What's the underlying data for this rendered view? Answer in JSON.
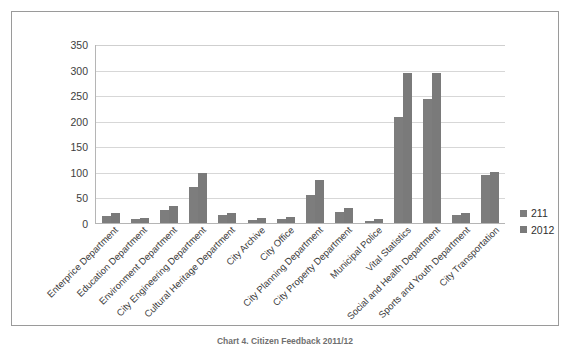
{
  "figure": {
    "caption": "Chart 4. Citizen Feedback 2011/12"
  },
  "legend": {
    "position": "right",
    "items": [
      {
        "label": "211",
        "color": "#7d7d7d"
      },
      {
        "label": "2012",
        "color": "#7a7a7a"
      }
    ]
  },
  "chart_data": {
    "type": "bar",
    "title": "",
    "xlabel": "",
    "ylabel": "",
    "ylim": [
      0,
      350
    ],
    "yticks": [
      0,
      50,
      100,
      150,
      200,
      250,
      300,
      350
    ],
    "grid": true,
    "legend_position": "right",
    "categories": [
      "Enterprice Department",
      "Education Department",
      "Environment Department",
      "City Engineering Department",
      "Cultural Heritage Department",
      "City Archive",
      "City Office",
      "City Planning Department",
      "City Property Department",
      "Municipal Police",
      "Vital Statistics",
      "Social and Health Department",
      "Sports and Youth Department",
      "City Transportation"
    ],
    "series": [
      {
        "name": "211",
        "color": "#7d7d7d",
        "values": [
          14,
          20,
          8,
          10,
          25,
          33,
          70,
          97,
          15,
          19,
          6,
          9,
          8,
          12
        ]
      },
      {
        "name": "2012",
        "color": "#7a7a7a",
        "values": [
          55,
          85,
          22,
          30,
          4,
          8,
          207,
          293,
          242,
          293,
          15,
          20,
          93,
          100
        ]
      }
    ],
    "groups": [
      {
        "category": "Enterprice Department",
        "v211": 14,
        "v2012": 20
      },
      {
        "category": "Education Department",
        "v211": 8,
        "v2012": 10
      },
      {
        "category": "Environment Department",
        "v211": 25,
        "v2012": 33
      },
      {
        "category": "City Engineering Department",
        "v211": 70,
        "v2012": 97
      },
      {
        "category": "Cultural Heritage Department",
        "v211": 15,
        "v2012": 19
      },
      {
        "category": "City Archive",
        "v211": 6,
        "v2012": 9
      },
      {
        "category": "City Office",
        "v211": 8,
        "v2012": 12
      },
      {
        "category": "City Planning Department",
        "v211": 55,
        "v2012": 85
      },
      {
        "category": "City Property Department",
        "v211": 22,
        "v2012": 30
      },
      {
        "category": "Municipal Police",
        "v211": 4,
        "v2012": 8
      },
      {
        "category": "Vital Statistics",
        "v211": 207,
        "v2012": 293
      },
      {
        "category": "Social and Health Department",
        "v211": 242,
        "v2012": 293
      },
      {
        "category": "Sports and Youth Department",
        "v211": 15,
        "v2012": 20
      },
      {
        "category": "City Transportation",
        "v211": 93,
        "v2012": 100
      }
    ]
  }
}
